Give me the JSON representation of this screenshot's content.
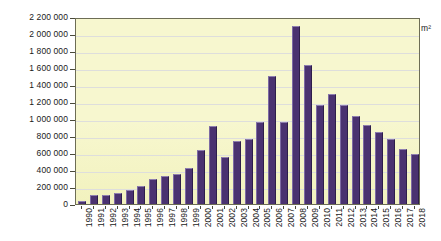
{
  "chart_data": {
    "type": "bar",
    "title": "",
    "xlabel": "",
    "ylabel": "m²",
    "unit": "m²",
    "ylim": [
      0,
      2200000
    ],
    "ytick_step": 200000,
    "grid": true,
    "legend": "none",
    "bar_color": "#4a3270",
    "plot_background": "#f7f7cf",
    "ytick_labels": [
      "2 200 000",
      "2 000 000",
      "1 800 000",
      "1 600 000",
      "1 400 000",
      "1 200 000",
      "1 000 000",
      "800 000",
      "600 000",
      "400 000",
      "200 000",
      "0"
    ],
    "categories": [
      "1990",
      "1991",
      "1992",
      "1993",
      "1994",
      "1995",
      "1996",
      "1997",
      "1998",
      "1999",
      "2000",
      "2001",
      "2002",
      "2003",
      "2004",
      "2005",
      "2006",
      "2007",
      "2008",
      "2009",
      "2010",
      "2011",
      "2012",
      "2013",
      "2014",
      "2015",
      "2016",
      "2017",
      "2018"
    ],
    "values": [
      30000,
      110000,
      105000,
      135000,
      160000,
      215000,
      290000,
      325000,
      350000,
      425000,
      630000,
      915000,
      555000,
      740000,
      765000,
      965000,
      1510000,
      960000,
      2100000,
      1630000,
      1160000,
      1290000,
      1170000,
      1030000,
      935000,
      850000,
      760000,
      650000,
      590000
    ]
  }
}
